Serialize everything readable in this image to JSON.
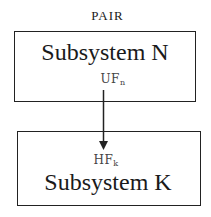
{
  "diagram": {
    "title": "PAIR",
    "nodes": [
      {
        "id": "subsystem-n",
        "label": "Subsystem N",
        "port": {
          "base": "UF",
          "subscript": "n"
        }
      },
      {
        "id": "subsystem-k",
        "label": "Subsystem K",
        "port": {
          "base": "HF",
          "subscript": "k"
        }
      }
    ],
    "edges": [
      {
        "from": "subsystem-n",
        "to": "subsystem-k",
        "from_port": "UF_n",
        "to_port": "HF_k",
        "style": "arrow"
      }
    ],
    "colors": {
      "stroke": "#222222",
      "text": "#1a1a1a",
      "background": "#ffffff"
    }
  }
}
